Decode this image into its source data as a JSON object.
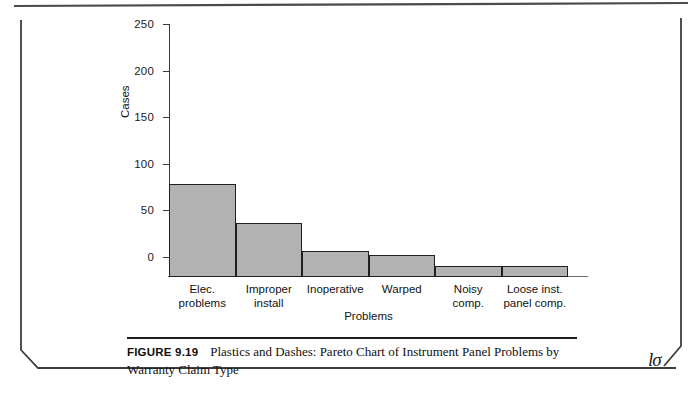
{
  "figure": {
    "caption_label": "FIGURE 9.19",
    "caption_text": "Plastics and Dashes: Pareto Chart of Instrument Panel Problems by Warranty Claim Type",
    "publisher_mark": "lσ"
  },
  "chart_data": {
    "type": "bar",
    "title": "",
    "xlabel": "Problems",
    "ylabel": "Cases",
    "categories": [
      "Elec. problems",
      "Improper install",
      "Inoperative",
      "Warped",
      "Noisy comp.",
      "Loose inst. panel comp."
    ],
    "category_lines": [
      [
        "Elec.",
        "problems"
      ],
      [
        "Improper",
        "install"
      ],
      [
        "Inoperative",
        ""
      ],
      [
        "Warped",
        ""
      ],
      [
        "Noisy",
        "comp."
      ],
      [
        "Loose inst.",
        "panel comp."
      ]
    ],
    "values": [
      97,
      57,
      27,
      23,
      12,
      12
    ],
    "ylim": [
      0,
      265
    ],
    "yticks": [
      0,
      50,
      100,
      150,
      200,
      250
    ],
    "ytick_labels": [
      "0",
      "50",
      "100",
      "150",
      "200",
      "250"
    ],
    "grid": false,
    "legend": "none",
    "bar_fill": "#b2b2b2",
    "bar_edge": "#1f1f1f"
  }
}
